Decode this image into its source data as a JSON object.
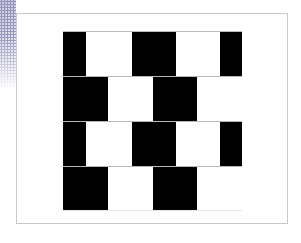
{
  "figure": {
    "colors": {
      "tile_dark": "#000000",
      "tile_light": "#ffffff",
      "mortar": "#b8b8b8",
      "frame_border": "#c8c8c8",
      "halftone": "#7878aa"
    },
    "rows": [
      {
        "tiles": [
          {
            "color": "black",
            "x": 0,
            "w": 23
          },
          {
            "color": "white",
            "x": 23,
            "w": 46
          },
          {
            "color": "black",
            "x": 69,
            "w": 44
          },
          {
            "color": "white",
            "x": 113,
            "w": 44
          },
          {
            "color": "black",
            "x": 157,
            "w": 22
          }
        ]
      },
      {
        "tiles": [
          {
            "color": "black",
            "x": 0,
            "w": 45
          },
          {
            "color": "white",
            "x": 45,
            "w": 45
          },
          {
            "color": "black",
            "x": 90,
            "w": 44
          },
          {
            "color": "white",
            "x": 134,
            "w": 45
          }
        ]
      },
      {
        "tiles": [
          {
            "color": "black",
            "x": 0,
            "w": 23
          },
          {
            "color": "white",
            "x": 23,
            "w": 46
          },
          {
            "color": "black",
            "x": 69,
            "w": 44
          },
          {
            "color": "white",
            "x": 113,
            "w": 44
          },
          {
            "color": "black",
            "x": 157,
            "w": 22
          }
        ]
      },
      {
        "tiles": [
          {
            "color": "black",
            "x": 0,
            "w": 45
          },
          {
            "color": "white",
            "x": 45,
            "w": 45
          },
          {
            "color": "black",
            "x": 90,
            "w": 44
          },
          {
            "color": "white",
            "x": 134,
            "w": 45
          }
        ]
      }
    ]
  }
}
